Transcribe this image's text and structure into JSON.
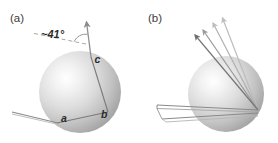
{
  "figure": {
    "background_color": "#ffffff",
    "width": 278,
    "height": 143,
    "panels": [
      {
        "id": "a",
        "label": "(a)",
        "label_x": 10,
        "label_y": 22,
        "sphere": {
          "cx": 80,
          "cy": 92,
          "r": 41,
          "highlight_x": 66,
          "highlight_y": 78,
          "color_light": "#fcfcfc",
          "color_mid": "#d8d8d8",
          "color_dark": "#a9a9a9"
        },
        "annotations": [
          {
            "name": "angle-label",
            "text": "~41°",
            "x": 41,
            "y": 38
          },
          {
            "name": "point-label-a",
            "text": "a",
            "x": 61,
            "y": 122
          },
          {
            "name": "point-label-b",
            "text": "b",
            "x": 102,
            "y": 118
          },
          {
            "name": "point-label-c",
            "text": "c",
            "x": 95,
            "y": 63
          }
        ],
        "vectors": {
          "outgoing_arrow": {
            "x1": 85,
            "y1": 48,
            "x2": 87,
            "y2": 18
          },
          "dashed_reference": {
            "x1": 83,
            "y1": 45,
            "x2": 32,
            "y2": 34
          },
          "incoming_ray": {
            "x1": 12,
            "y1": 112,
            "x2": 57,
            "y2": 123
          },
          "chord_ab": {
            "x1": 57,
            "y1": 123,
            "x2": 108,
            "y2": 112
          },
          "chord_bc": {
            "x1": 108,
            "y1": 112,
            "x2": 91,
            "y2": 57
          },
          "chord_ca": {
            "x1": 91,
            "y1": 57,
            "x2": 85,
            "y2": 48
          }
        }
      },
      {
        "id": "b",
        "label": "(b)",
        "label_x": 148,
        "label_y": 22,
        "sphere": {
          "cx": 226,
          "cy": 94,
          "r": 38,
          "highlight_x": 213,
          "highlight_y": 82,
          "color_light": "#fcfcfc",
          "color_mid": "#d8d8d8",
          "color_dark": "#a9a9a9"
        },
        "fan_arrow_count": 4,
        "fan_origin": {
          "x": 258,
          "y": 110
        },
        "fan_tips": [
          {
            "x": 221,
            "y": 14
          },
          {
            "x": 211,
            "y": 19
          },
          {
            "x": 201,
            "y": 26
          },
          {
            "x": 193,
            "y": 32
          }
        ],
        "incoming_rays": [
          {
            "x1": 157,
            "y1": 106,
            "x2": 258,
            "y2": 110
          },
          {
            "x1": 157,
            "y1": 110,
            "x2": 258,
            "y2": 113
          },
          {
            "x1": 162,
            "y1": 118,
            "x2": 258,
            "y2": 113
          }
        ]
      }
    ]
  }
}
